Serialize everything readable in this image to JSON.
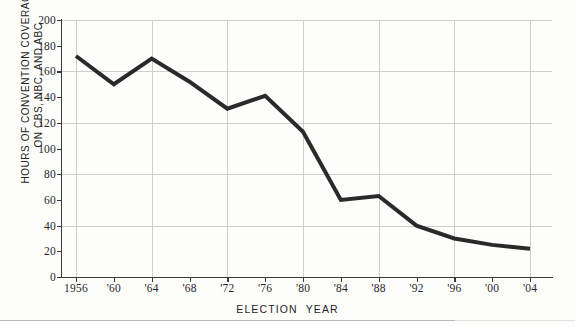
{
  "page": {
    "top_fragment": "",
    "background_color": "#fdfdfb"
  },
  "axis_titles": {
    "y_line1": "HOURS OF CONVENTION COVERAGE",
    "y_line2": "ON CBS, NBC, AND ABC",
    "x_word1": "ELECTION",
    "x_word2": "YEAR"
  },
  "chart_data": {
    "type": "line",
    "title": "",
    "xlabel": "ELECTION YEAR",
    "ylabel": "HOURS OF CONVENTION COVERAGE ON CBS, NBC, AND ABC",
    "categories": [
      "1956",
      "'60",
      "'64",
      "'68",
      "'72",
      "'76",
      "'80",
      "'84",
      "'88",
      "'92",
      "'96",
      "'00",
      "'04"
    ],
    "x_values": [
      1956,
      1960,
      1964,
      1968,
      1972,
      1976,
      1980,
      1984,
      1988,
      1992,
      1996,
      2000,
      2004
    ],
    "values": [
      172,
      150,
      170,
      152,
      131,
      141,
      113,
      60,
      63,
      40,
      30,
      25,
      22
    ],
    "series": [
      {
        "name": "Hours of convention coverage",
        "color": "#2a2a2a",
        "values": [
          172,
          150,
          170,
          152,
          131,
          141,
          113,
          60,
          63,
          40,
          30,
          25,
          22
        ]
      }
    ],
    "ylim": [
      0,
      200
    ],
    "xlim": [
      1956,
      2004
    ],
    "y_ticks": [
      0,
      20,
      40,
      60,
      80,
      100,
      120,
      140,
      160,
      180,
      200
    ],
    "y_tick_labels": [
      "0",
      "20",
      "40",
      "60",
      "80",
      "100",
      "120",
      "140",
      "160",
      "180",
      "200"
    ],
    "y_gridlines": [
      40,
      80,
      120,
      160,
      200
    ],
    "x_gridlines": [
      "1956",
      "'64",
      "'72",
      "'80",
      "'88",
      "'96",
      "'04"
    ],
    "grid": true,
    "legend": "none",
    "line_width": 4,
    "line_color": "#2a2a2a",
    "grid_color": "#cfcfcf",
    "axis_color": "#3a3a3a"
  }
}
